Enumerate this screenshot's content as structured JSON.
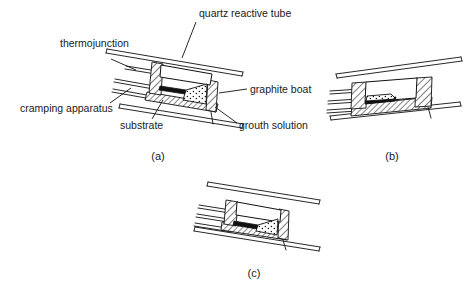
{
  "figure": {
    "style": "monochrome line drawing",
    "ink_color": "#111111",
    "background_color": "#ffffff",
    "labels": [
      {
        "id": "quartz-reactive-tube",
        "text": "quartz reactive tube"
      },
      {
        "id": "thermojunction",
        "text": "thermojunction"
      },
      {
        "id": "cramping-apparatus",
        "text": "cramping apparatus"
      },
      {
        "id": "substrate",
        "text": "substrate"
      },
      {
        "id": "graphite-boat",
        "text": "graphite boat"
      },
      {
        "id": "grouth-solution",
        "text": "grouth solution"
      }
    ],
    "panels": [
      {
        "id": "a",
        "caption": "(a)",
        "description": "boat tilted, solution at right, substrate at left"
      },
      {
        "id": "b",
        "caption": "(b)",
        "description": "boat viewed with solution contacting substrate"
      },
      {
        "id": "c",
        "caption": "(c)",
        "description": "boat after solution sweep, compact view"
      }
    ]
  }
}
